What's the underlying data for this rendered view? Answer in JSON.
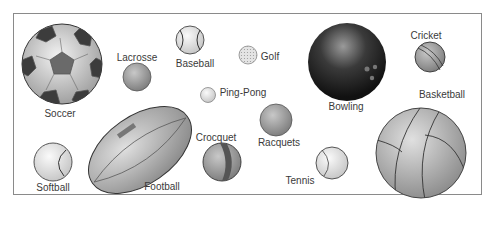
{
  "figure": {
    "labels": {
      "soccer": "Soccer",
      "lacrosse": "Lacrosse",
      "baseball": "Baseball",
      "golf": "Golf",
      "ping_pong": "Ping-Pong",
      "bowling": "Bowling",
      "cricket": "Cricket",
      "basketball": "Basketball",
      "racquets": "Racquets",
      "tennis": "Tennis",
      "crocquet": "Crocquet",
      "football": "Football",
      "softball": "Softball"
    }
  }
}
